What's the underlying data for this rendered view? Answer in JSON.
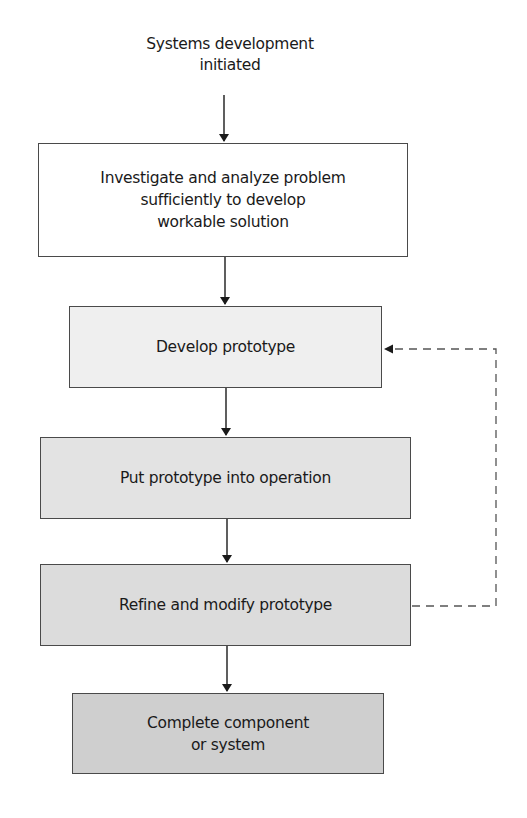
{
  "diagram": {
    "type": "flowchart",
    "start": {
      "label": "Systems development\ninitiated"
    },
    "steps": [
      {
        "id": "investigate",
        "label": "Investigate and analyze problem\nsufficiently to develop\nworkable solution",
        "fill": "#ffffff"
      },
      {
        "id": "develop",
        "label": "Develop prototype",
        "fill": "#efefef"
      },
      {
        "id": "operate",
        "label": "Put prototype into operation",
        "fill": "#e3e3e3"
      },
      {
        "id": "refine",
        "label": "Refine and modify prototype",
        "fill": "#dcdcdc"
      },
      {
        "id": "complete",
        "label": "Complete component\nor system",
        "fill": "#cfcfcf"
      }
    ],
    "edges": [
      {
        "from": "start",
        "to": "investigate",
        "style": "solid"
      },
      {
        "from": "investigate",
        "to": "develop",
        "style": "solid"
      },
      {
        "from": "develop",
        "to": "operate",
        "style": "solid"
      },
      {
        "from": "operate",
        "to": "refine",
        "style": "solid"
      },
      {
        "from": "refine",
        "to": "complete",
        "style": "solid"
      },
      {
        "from": "refine",
        "to": "develop",
        "style": "dashed",
        "kind": "feedback-loop"
      }
    ],
    "colors": {
      "stroke": "#4a4a4a",
      "arrow": "#1a1a1a",
      "dashed": "#555555"
    }
  }
}
